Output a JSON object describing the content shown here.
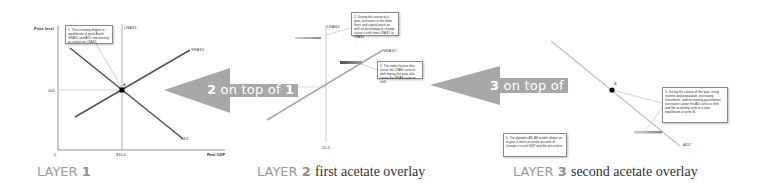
{
  "layer1": {
    "y_axis_label": "Price level",
    "x_axis_label": "Real GDP",
    "origin_label": "0",
    "price_tick": "100",
    "gdp_tick": "$10.0",
    "curve_lras": "LRAS1",
    "curve_sras": "SRAS1",
    "curve_ad": "AD1",
    "point_label": "A",
    "note": "1. The economy begins in equilibrium at point A with SRAS1 and AD1 intersecting at a point on LRAS1.",
    "caption_word": "LAYER",
    "caption_num": "1"
  },
  "arrow1": {
    "num_a": "2",
    "mid": " on top of ",
    "num_b": "1",
    "color": "#a8a8a8"
  },
  "layer2": {
    "curve_lras": "LRAS2",
    "curve_sras": "SRAS2",
    "gdp_tick": "10.3",
    "note_a": "2. During the course of a year, increases in the labor force and capital stock as well as technological change cause a shift from LRAS1 to LRAS2.",
    "note_b": "3. The same factors that cause the LRAS curve to shift during the year also cause the SRAS curve to shift.",
    "caption_word": "LAYER",
    "caption_num": "2",
    "caption_desc": "first acetate overlay"
  },
  "arrow2": {
    "num_a": "3",
    "mid": " on top of ",
    "num_b": "2",
    "color": "#a8a8a8"
  },
  "layer3": {
    "curve_ad": "AD2",
    "point_label": "B",
    "note_a": "4. During the course of the year, rising income and population, increasing investment, and increasing government purchases cause the AD curve to shift, and the economy ends in a new equilibrium at point B.",
    "note_b": "5. The dynamic AD-AS model allows us to give a more accurate account of changes in real GDP and the price level.",
    "caption_word": "LAYER",
    "caption_num": "3",
    "caption_desc": "second acetate overlay"
  }
}
